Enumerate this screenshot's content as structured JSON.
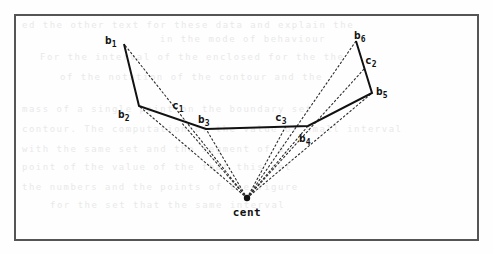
{
  "figure": {
    "title": "",
    "caption": "",
    "frame": {
      "x": 15,
      "y": 15,
      "width": 463,
      "height": 225,
      "color": "#555555",
      "stroke_width": 2
    },
    "background_color": "#fefefe",
    "solid_line_color": "#111111",
    "dotted_line_color": "#2b2b2b",
    "center_label": "cent",
    "center_point": {
      "name": "cent",
      "x": 247,
      "y": 198
    },
    "boundary_points": [
      {
        "base": "b",
        "sub": "1",
        "x": 124,
        "y": 44,
        "label_x": 105,
        "label_y": 44
      },
      {
        "base": "b",
        "sub": "2",
        "x": 139,
        "y": 106,
        "label_x": 118,
        "label_y": 118
      },
      {
        "base": "b",
        "sub": "3",
        "x": 206,
        "y": 129,
        "label_x": 198,
        "label_y": 123
      },
      {
        "base": "b",
        "sub": "4",
        "x": 308,
        "y": 126,
        "label_x": 299,
        "label_y": 142
      },
      {
        "base": "b",
        "sub": "5",
        "x": 372,
        "y": 93,
        "label_x": 376,
        "label_y": 95
      },
      {
        "base": "b",
        "sub": "6",
        "x": 356,
        "y": 41,
        "label_x": 354,
        "label_y": 39
      }
    ],
    "control_points": [
      {
        "base": "c",
        "sub": "1",
        "x": 181,
        "y": 122,
        "label_x": 172,
        "label_y": 109
      },
      {
        "base": "c",
        "sub": "2",
        "x": 365,
        "y": 68,
        "label_x": 365,
        "label_y": 64
      },
      {
        "base": "c",
        "sub": "3",
        "x": 286,
        "y": 126,
        "label_x": 275,
        "label_y": 121
      }
    ],
    "solid_polyline": [
      {
        "x": 124,
        "y": 44
      },
      {
        "x": 139,
        "y": 106
      },
      {
        "x": 206,
        "y": 129
      },
      {
        "x": 308,
        "y": 126
      },
      {
        "x": 372,
        "y": 93
      },
      {
        "x": 356,
        "y": 41
      }
    ],
    "dotted_rays_from_center": [
      {
        "to": "b1",
        "x": 124,
        "y": 44
      },
      {
        "to": "b2",
        "x": 139,
        "y": 106
      },
      {
        "to": "c1",
        "x": 181,
        "y": 122
      },
      {
        "to": "b3",
        "x": 206,
        "y": 129
      },
      {
        "to": "c3",
        "x": 286,
        "y": 126
      },
      {
        "to": "b4",
        "x": 308,
        "y": 126
      },
      {
        "to": "b5",
        "x": 372,
        "y": 93
      },
      {
        "to": "c2",
        "x": 365,
        "y": 68
      },
      {
        "to": "b6",
        "x": 356,
        "y": 41
      }
    ],
    "bleed_through_text": [
      {
        "text": "ed the other text for these data and explain the",
        "x": 22,
        "y": 20
      },
      {
        "text": "in the mode of behaviour",
        "x": 160,
        "y": 34
      },
      {
        "text": "For the interval of  the   enclosed for  the  the",
        "x": 40,
        "y": 52
      },
      {
        "text": "of  the  notation of  the  contour  and  the",
        "x": 60,
        "y": 72
      },
      {
        "text": "mass  of a single  point  on  the  boundary  set",
        "x": 22,
        "y": 104
      },
      {
        "text": "contour.  The computation of the value of  small  interval",
        "x": 22,
        "y": 124
      },
      {
        "text": "with  the  same  set  and  the   segment  of  a",
        "x": 22,
        "y": 144
      },
      {
        "text": "point  of  the  value  of  the  that  this  set",
        "x": 22,
        "y": 162
      },
      {
        "text": "the  numbers  and  the  points  of  the  figure",
        "x": 22,
        "y": 182
      },
      {
        "text": "for  the   set   that   the   same   interval",
        "x": 50,
        "y": 200
      }
    ]
  }
}
